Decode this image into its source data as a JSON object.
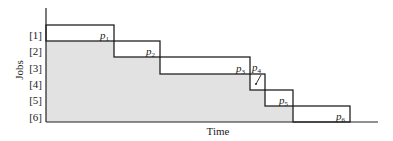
{
  "diagram": {
    "type": "gantt-staircase",
    "y_axis_label": "Jobs",
    "x_axis_label": "Time",
    "jobs": [
      {
        "label": "[1]",
        "name": "p",
        "sub": "1",
        "x0": 46,
        "x1": 114,
        "y0": 25,
        "y1": 41
      },
      {
        "label": "[2]",
        "name": "p",
        "sub": "2",
        "x0": 114,
        "x1": 160,
        "y0": 41,
        "y1": 57
      },
      {
        "label": "[3]",
        "name": "p",
        "sub": "3",
        "x0": 160,
        "x1": 250,
        "y0": 57,
        "y1": 74
      },
      {
        "label": "[4]",
        "name": "p",
        "sub": "4",
        "x0": 250,
        "x1": 265,
        "y0": 74,
        "y1": 90
      },
      {
        "label": "[5]",
        "name": "p",
        "sub": "5",
        "x0": 265,
        "x1": 293,
        "y0": 90,
        "y1": 106
      },
      {
        "label": "[6]",
        "name": "p",
        "sub": "6",
        "x0": 293,
        "x1": 350,
        "y0": 106,
        "y1": 122
      }
    ],
    "shaded_region": "waiting time (area under staircase)",
    "colors": {
      "line": "#222222",
      "shade": "#e2e2e2"
    }
  }
}
